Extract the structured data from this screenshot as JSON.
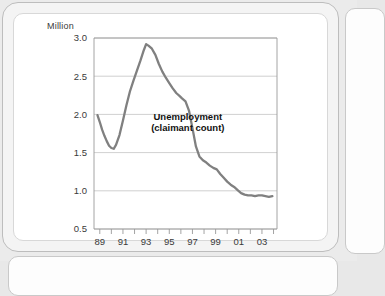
{
  "chart_data": {
    "type": "line",
    "title": "",
    "xlabel": "",
    "ylabel": "Million",
    "unit_label": "Million",
    "ylim": [
      0.5,
      3.0
    ],
    "xlim": [
      1988.5,
      2004.3
    ],
    "grid": true,
    "legend": "none",
    "yticks": [
      "3.0",
      "2.5",
      "2.0",
      "1.5",
      "1.0",
      "0.5"
    ],
    "ytick_values": [
      3.0,
      2.5,
      2.0,
      1.5,
      1.0,
      0.5
    ],
    "xticks": [
      "89",
      "91",
      "93",
      "95",
      "97",
      "99",
      "01",
      "03"
    ],
    "xtick_values": [
      1989,
      1991,
      1993,
      1995,
      1997,
      1999,
      2001,
      2003
    ],
    "xminor_values": [
      1990,
      1992,
      1994,
      1996,
      1998,
      2000,
      2002,
      2004
    ],
    "annotations": [
      {
        "text_line1": "Unemployment",
        "text_line2": "(claimant count)",
        "x": 1996.6,
        "y": 1.93
      }
    ],
    "series": [
      {
        "name": "Unemployment (claimant count)",
        "color": "#808080",
        "x": [
          1988.8,
          1989.0,
          1989.2,
          1989.4,
          1989.6,
          1989.8,
          1990.0,
          1990.2,
          1990.4,
          1990.7,
          1991.0,
          1991.3,
          1991.6,
          1991.9,
          1992.2,
          1992.5,
          1992.8,
          1993.0,
          1993.2,
          1993.5,
          1993.8,
          1994.1,
          1994.4,
          1994.7,
          1995.0,
          1995.3,
          1995.6,
          1995.9,
          1996.1,
          1996.4,
          1996.7,
          1997.0,
          1997.3,
          1997.6,
          1997.9,
          1998.2,
          1998.5,
          1998.8,
          1999.1,
          1999.4,
          1999.7,
          2000.0,
          2000.3,
          2000.6,
          2000.9,
          2001.2,
          2001.5,
          2001.8,
          2002.1,
          2002.4,
          2002.7,
          2003.0,
          2003.3,
          2003.6,
          2003.9
        ],
        "y": [
          1.99,
          1.9,
          1.8,
          1.72,
          1.65,
          1.59,
          1.56,
          1.55,
          1.6,
          1.73,
          1.92,
          2.12,
          2.3,
          2.44,
          2.57,
          2.7,
          2.84,
          2.92,
          2.9,
          2.86,
          2.78,
          2.66,
          2.56,
          2.48,
          2.41,
          2.34,
          2.28,
          2.24,
          2.21,
          2.17,
          2.05,
          1.82,
          1.58,
          1.45,
          1.4,
          1.37,
          1.33,
          1.3,
          1.28,
          1.22,
          1.17,
          1.12,
          1.08,
          1.05,
          1.01,
          0.97,
          0.95,
          0.94,
          0.94,
          0.93,
          0.94,
          0.94,
          0.93,
          0.92,
          0.93
        ]
      }
    ]
  },
  "colors": {
    "line": "#808080",
    "grid": "#c4c4c4",
    "axis": "#9a9a9a",
    "text": "#333333",
    "card": "#ffffff",
    "frame": "#f4f4f4"
  }
}
